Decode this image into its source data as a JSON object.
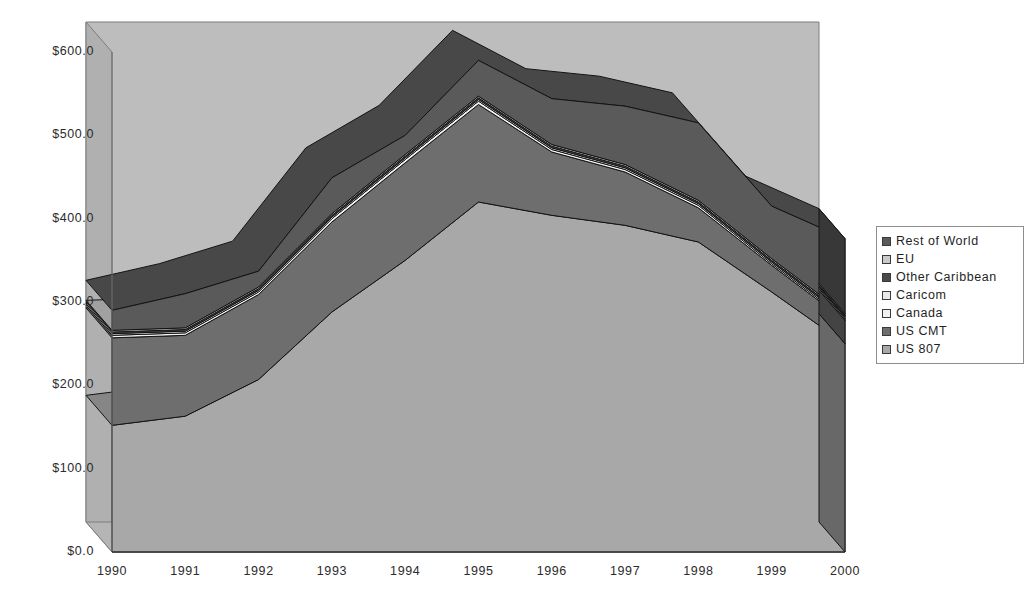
{
  "chart_data": {
    "type": "area",
    "stacked": true,
    "three_d": true,
    "title": "",
    "xlabel": "",
    "ylabel": "",
    "categories": [
      "1990",
      "1991",
      "1992",
      "1993",
      "1994",
      "1995",
      "1996",
      "1997",
      "1998",
      "1999",
      "2000"
    ],
    "ytick_labels": [
      "$0.0",
      "$100.0",
      "$200.0",
      "$300.0",
      "$400.0",
      "$500.0",
      "$600.0"
    ],
    "ytick_values": [
      0,
      100,
      200,
      300,
      400,
      500,
      600
    ],
    "ylim": [
      0,
      600
    ],
    "grid": false,
    "legend_position": "right",
    "value_prefix": "$",
    "series": [
      {
        "name": "US 807",
        "color": "#a8a8a8",
        "values": [
          152,
          163,
          207,
          288,
          350,
          420,
          404,
          392,
          372,
          312,
          250
        ]
      },
      {
        "name": "US CMT",
        "color": "#6e6e6e",
        "values": [
          105,
          97,
          102,
          108,
          117,
          117,
          76,
          64,
          41,
          32,
          28
        ]
      },
      {
        "name": "Canada",
        "color": "#f2f2f2",
        "values": [
          3,
          3,
          3,
          4,
          4,
          4,
          3,
          3,
          3,
          2,
          2
        ]
      },
      {
        "name": "Caricom",
        "color": "#e8e8e8",
        "values": [
          2,
          2,
          2,
          2,
          2,
          2,
          2,
          2,
          2,
          2,
          2
        ]
      },
      {
        "name": "Other Caribbean",
        "color": "#4a4a4a",
        "values": [
          2,
          2,
          2,
          2,
          2,
          2,
          2,
          2,
          2,
          2,
          2
        ]
      },
      {
        "name": "EU",
        "color": "#c9c9c9",
        "values": [
          2,
          2,
          2,
          2,
          2,
          2,
          2,
          2,
          2,
          2,
          2
        ]
      },
      {
        "name": "Rest of World",
        "color": "#5a5a5a",
        "values": [
          24,
          41,
          19,
          43,
          23,
          43,
          55,
          70,
          93,
          63,
          90
        ]
      }
    ],
    "stack_tops": {
      "1990": [
        152,
        257,
        260,
        262,
        264,
        266,
        290
      ],
      "1991": [
        163,
        260,
        263,
        265,
        267,
        269,
        310
      ],
      "1992": [
        207,
        309,
        312,
        314,
        316,
        318,
        337
      ],
      "1993": [
        288,
        396,
        400,
        402,
        404,
        406,
        449
      ],
      "1994": [
        350,
        467,
        471,
        473,
        475,
        477,
        500
      ],
      "1995": [
        420,
        537,
        541,
        543,
        545,
        547,
        590
      ],
      "1996": [
        404,
        480,
        483,
        485,
        487,
        489,
        544
      ],
      "1997": [
        392,
        456,
        459,
        461,
        463,
        465,
        535
      ],
      "1998": [
        372,
        413,
        416,
        418,
        420,
        422,
        515
      ],
      "1999": [
        312,
        344,
        346,
        348,
        350,
        352,
        415
      ],
      "2000": [
        250,
        278,
        280,
        282,
        284,
        286,
        376
      ]
    }
  },
  "legend": {
    "items": [
      {
        "label": "Rest of World",
        "color": "#5a5a5a"
      },
      {
        "label": "EU",
        "color": "#c9c9c9"
      },
      {
        "label": "Other Caribbean",
        "color": "#4a4a4a"
      },
      {
        "label": "Caricom",
        "color": "#e8e8e8"
      },
      {
        "label": "Canada",
        "color": "#f2f2f2"
      },
      {
        "label": "US CMT",
        "color": "#6e6e6e"
      },
      {
        "label": "US 807",
        "color": "#a8a8a8"
      }
    ]
  },
  "palette": {
    "plot_background": "#bdbdbd",
    "wall_left": "#b0b0b0",
    "floor": "#b5b5b5",
    "outline": "#141414",
    "axis_text": "#2b2b2b",
    "page_background": "#ffffff"
  }
}
